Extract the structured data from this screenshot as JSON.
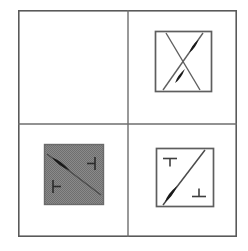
{
  "figure": {
    "width": 248,
    "height": 251,
    "background_color": "#ffffff",
    "layout": {
      "type": "grid",
      "rows": 2,
      "columns": 2,
      "outer_border": {
        "x": 18,
        "y": 10,
        "width": 219,
        "height": 227,
        "stroke_color": "#5a5a5a"
      },
      "divider_vertical_x": 128,
      "divider_horizontal_y": 124,
      "divider_color": "#6e6e6e"
    },
    "colors": {
      "outline": "#5a5a5a",
      "divider": "#6e6e6e",
      "inner_box_stroke": "#5e5e5e",
      "line": "#4b4b4b",
      "spindle_fill": "#1a1a1a",
      "tee_mark": "#3f3f3f",
      "shaded_fill": "#808080",
      "page_background": "#ffffff"
    },
    "panels": [
      {
        "id": "panel-top-left",
        "position": "top-left",
        "label": "",
        "content_type": "empty",
        "shaded": false,
        "inner_box": null,
        "lines": [],
        "spindles": [],
        "tee_marks": []
      },
      {
        "id": "panel-top-right",
        "position": "top-right",
        "label": "",
        "content_type": "crossed-lines",
        "shaded": false,
        "inner_box": {
          "x": 155,
          "y": 31,
          "width": 57,
          "height": 61
        },
        "lines": [
          {
            "id": "diagonal-down",
            "x1": 166,
            "y1": 33,
            "x2": 200,
            "y2": 90,
            "weight": "light"
          },
          {
            "id": "diagonal-up",
            "x1": 163,
            "y1": 90,
            "x2": 203,
            "y2": 33,
            "weight": "light"
          }
        ],
        "spindles": [
          {
            "id": "spindle-upper",
            "cx": 194,
            "cy": 46,
            "length": 16,
            "width": 5,
            "angle_deg": -55
          },
          {
            "id": "spindle-lower",
            "cx": 180,
            "cy": 76,
            "length": 17,
            "width": 5,
            "angle_deg": -55
          }
        ],
        "tee_marks": []
      },
      {
        "id": "panel-bottom-left",
        "position": "bottom-left",
        "label": "",
        "content_type": "shaded-diagonal-with-tees",
        "shaded": true,
        "inner_box": {
          "x": 44,
          "y": 144,
          "width": 60,
          "height": 61
        },
        "lines": [
          {
            "id": "diagonal-descending",
            "x1": 47,
            "y1": 154,
            "x2": 101,
            "y2": 195,
            "weight": "normal"
          }
        ],
        "spindles": [
          {
            "id": "spindle-left",
            "cx": 61,
            "cy": 164,
            "length": 22,
            "width": 6,
            "angle_deg": 37
          }
        ],
        "tee_marks": [
          {
            "id": "tee-right",
            "x": 90,
            "y": 163,
            "orientation": "pointing-left",
            "bar_length": 13,
            "stem_length": 8
          },
          {
            "id": "tee-lower-left",
            "x": 58,
            "y": 186,
            "orientation": "pointing-right",
            "bar_length": 13,
            "stem_length": 8
          }
        ]
      },
      {
        "id": "panel-bottom-right",
        "position": "bottom-right",
        "label": "",
        "content_type": "diagonal-with-tees",
        "shaded": false,
        "inner_box": {
          "x": 156,
          "y": 148,
          "width": 58,
          "height": 59
        },
        "lines": [
          {
            "id": "diagonal-ascending",
            "x1": 163,
            "y1": 205,
            "x2": 205,
            "y2": 150,
            "weight": "normal"
          }
        ],
        "spindles": [
          {
            "id": "spindle-bottom",
            "cx": 171,
            "cy": 194,
            "length": 20,
            "width": 6,
            "angle_deg": -53
          }
        ],
        "tee_marks": [
          {
            "id": "tee-top-left",
            "x": 170,
            "y": 159,
            "orientation": "pointing-down",
            "bar_length": 14,
            "stem_length": 8
          },
          {
            "id": "tee-bottom-right",
            "x": 199,
            "y": 192,
            "orientation": "pointing-up",
            "bar_length": 14,
            "stem_length": 8
          }
        ]
      }
    ]
  }
}
